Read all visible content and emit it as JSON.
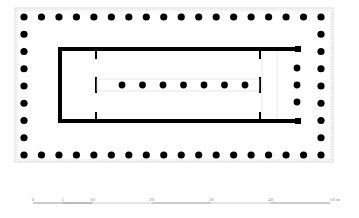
{
  "diagram": {
    "type": "temple-floor-plan",
    "peristyle": {
      "columns_long_side": 18,
      "columns_short_side": 9
    },
    "cella": {
      "inner_colonnade_columns": 7,
      "rear_porch_columns": 3
    }
  },
  "scale_bar": {
    "ticks": [
      {
        "label": "0",
        "value": 0
      },
      {
        "label": "5",
        "value": 5
      },
      {
        "label": "10",
        "value": 10
      },
      {
        "label": "20",
        "value": 20
      },
      {
        "label": "30",
        "value": 30
      },
      {
        "label": "40",
        "value": 40
      },
      {
        "label": "50 m",
        "value": 50
      }
    ],
    "unit": "m"
  },
  "colors": {
    "ink": "#000000",
    "stylobate_line": "#cccccc",
    "scale_bar": "#888888"
  }
}
